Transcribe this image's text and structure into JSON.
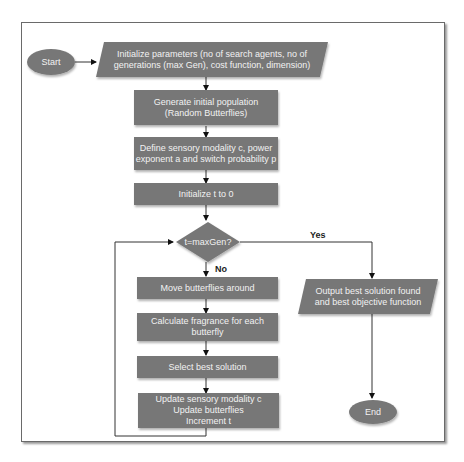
{
  "diagram": {
    "type": "flowchart",
    "colors": {
      "node_fill": "#777777",
      "node_text": "#f2f2f2",
      "edge": "#333333",
      "frame": "#6a6a6a"
    },
    "nodes": {
      "start": {
        "shape": "ellipse",
        "label": "Start"
      },
      "init_params": {
        "shape": "parallelogram",
        "label": "Initialize parameters (no of search agents, no of\ngenerations (max Gen), cost function, dimension)"
      },
      "gen_pop": {
        "shape": "rectangle",
        "label": "Generate initial population\n(Random Butterflies)"
      },
      "define_modality": {
        "shape": "rectangle",
        "label": "Define sensory modality c, power\nexponent a and switch probability p"
      },
      "init_t": {
        "shape": "rectangle",
        "label": "Initialize t to 0"
      },
      "decision": {
        "shape": "diamond",
        "label": "t=maxGen?"
      },
      "move": {
        "shape": "rectangle",
        "label": "Move butterflies around"
      },
      "fragrance": {
        "shape": "rectangle",
        "label": "Calculate fragrance for each\nbutterfly"
      },
      "select_best": {
        "shape": "rectangle",
        "label": "Select best solution"
      },
      "update": {
        "shape": "rectangle",
        "label": "Update sensory modality c\nUpdate butterflies\nIncrement t"
      },
      "output": {
        "shape": "parallelogram",
        "label": "Output best solution found\nand best objective function"
      },
      "end": {
        "shape": "ellipse",
        "label": "End"
      }
    },
    "edges": [
      {
        "from": "start",
        "to": "init_params",
        "label": ""
      },
      {
        "from": "init_params",
        "to": "gen_pop",
        "label": ""
      },
      {
        "from": "gen_pop",
        "to": "define_modality",
        "label": ""
      },
      {
        "from": "define_modality",
        "to": "init_t",
        "label": ""
      },
      {
        "from": "init_t",
        "to": "decision",
        "label": ""
      },
      {
        "from": "decision",
        "to": "output",
        "label": "Yes"
      },
      {
        "from": "decision",
        "to": "move",
        "label": "No"
      },
      {
        "from": "move",
        "to": "fragrance",
        "label": ""
      },
      {
        "from": "fragrance",
        "to": "select_best",
        "label": ""
      },
      {
        "from": "select_best",
        "to": "update",
        "label": ""
      },
      {
        "from": "update",
        "to": "decision",
        "label": ""
      },
      {
        "from": "output",
        "to": "end",
        "label": ""
      }
    ],
    "edge_labels": {
      "yes": "Yes",
      "no": "No"
    }
  }
}
